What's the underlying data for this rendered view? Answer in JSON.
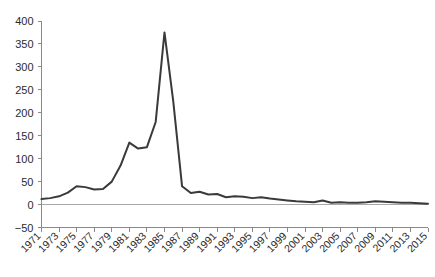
{
  "chart_data": {
    "type": "line",
    "title": "",
    "subtitle": "",
    "xlabel": "",
    "ylabel": "",
    "xlim": [
      1971,
      2015
    ],
    "ylim": [
      -50,
      400
    ],
    "grid": false,
    "legend": null,
    "zero_line": true,
    "line_color": "#3a3a3a",
    "axis_color": "#8a8a8a",
    "y_ticks": [
      400,
      350,
      300,
      250,
      200,
      150,
      100,
      50,
      0,
      -50
    ],
    "y_tick_labels": [
      "400",
      "350",
      "300",
      "250",
      "200",
      "150",
      "100",
      "50",
      "0",
      "−50"
    ],
    "x_ticks": [
      1971,
      1973,
      1975,
      1977,
      1979,
      1981,
      1983,
      1985,
      1987,
      1989,
      1991,
      1993,
      1995,
      1997,
      1999,
      2001,
      2003,
      2005,
      2007,
      2009,
      2011,
      2013,
      2015
    ],
    "x_tick_labels": [
      "1971",
      "1973",
      "1975",
      "1977",
      "1979",
      "1981",
      "1983",
      "1985",
      "1987",
      "1989",
      "1991",
      "1993",
      "1995",
      "1997",
      "1999",
      "2001",
      "2003",
      "2005",
      "2007",
      "2009",
      "2011",
      "2013",
      "2015"
    ],
    "x": [
      1971,
      1972,
      1973,
      1974,
      1975,
      1976,
      1977,
      1978,
      1979,
      1980,
      1981,
      1982,
      1983,
      1984,
      1985,
      1986,
      1987,
      1988,
      1989,
      1990,
      1991,
      1992,
      1993,
      1994,
      1995,
      1996,
      1997,
      1998,
      1999,
      2000,
      2001,
      2002,
      2003,
      2004,
      2005,
      2006,
      2007,
      2008,
      2009,
      2010,
      2011,
      2012,
      2013,
      2014,
      2015
    ],
    "values": [
      12,
      14,
      18,
      26,
      40,
      38,
      33,
      34,
      50,
      85,
      135,
      122,
      125,
      180,
      375,
      225,
      40,
      25,
      28,
      22,
      23,
      16,
      18,
      17,
      14,
      16,
      13,
      11,
      9,
      7,
      6,
      5,
      9,
      4,
      5,
      4,
      4,
      5,
      7,
      6,
      5,
      4,
      4,
      3,
      2
    ],
    "series": [
      {
        "name": "series-1",
        "values": [
          12,
          14,
          18,
          26,
          40,
          38,
          33,
          34,
          50,
          85,
          135,
          122,
          125,
          180,
          375,
          225,
          40,
          25,
          28,
          22,
          23,
          16,
          18,
          17,
          14,
          16,
          13,
          11,
          9,
          7,
          6,
          5,
          9,
          4,
          5,
          4,
          4,
          5,
          7,
          6,
          5,
          4,
          4,
          3,
          2
        ]
      }
    ],
    "annotations": []
  }
}
